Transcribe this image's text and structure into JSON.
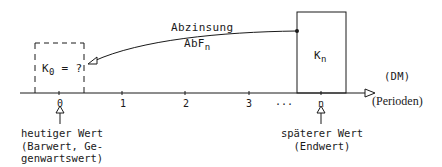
{
  "diagram": {
    "title": "Abzinsung",
    "arrow_label": {
      "top": "Abzinsung",
      "bottom_main": "AbF",
      "bottom_sub": "n"
    },
    "present_value_box": {
      "label_main": "K",
      "label_sub": "0",
      "label_rest": " = ?",
      "style": "dashed"
    },
    "future_value_box": {
      "label_main": "K",
      "label_sub": "n",
      "style": "solid"
    },
    "unit_label": "(DM)",
    "axis": {
      "label": "(Perioden)",
      "ticks": [
        "0",
        "1",
        "2",
        "3",
        "...",
        "n"
      ]
    },
    "annotations": {
      "present": [
        "heutiger Wert",
        "(Barwert, Ge-",
        "genwartswert)"
      ],
      "future": [
        "späterer Wert",
        "(Endwert)"
      ]
    },
    "colors": {
      "line": "#1a1a1a",
      "background": "#ffffff"
    }
  }
}
